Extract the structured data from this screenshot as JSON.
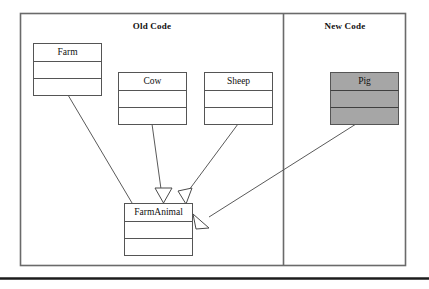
{
  "diagram": {
    "panels": [
      {
        "id": "old-code",
        "label": "Old Code"
      },
      {
        "id": "new-code",
        "label": "New Code"
      }
    ],
    "classes": [
      {
        "id": "farm",
        "name": "Farm",
        "fill": "#ffffff",
        "panel": "old-code"
      },
      {
        "id": "cow",
        "name": "Cow",
        "fill": "#ffffff",
        "panel": "old-code"
      },
      {
        "id": "sheep",
        "name": "Sheep",
        "fill": "#ffffff",
        "panel": "old-code"
      },
      {
        "id": "farmanimal",
        "name": "FarmAnimal",
        "fill": "#ffffff",
        "panel": "old-code"
      },
      {
        "id": "pig",
        "name": "Pig",
        "fill": "#a6a6a6",
        "panel": "new-code"
      }
    ],
    "relationships": [
      {
        "id": "farm-farmanimal",
        "from": "Farm",
        "to": "FarmAnimal",
        "type": "association"
      },
      {
        "id": "cow-farmanimal",
        "from": "Cow",
        "to": "FarmAnimal",
        "type": "generalization"
      },
      {
        "id": "sheep-farmanimal",
        "from": "Sheep",
        "to": "FarmAnimal",
        "type": "generalization"
      },
      {
        "id": "pig-farmanimal",
        "from": "Pig",
        "to": "FarmAnimal",
        "type": "generalization"
      }
    ],
    "colors": {
      "line": "#555555",
      "frame": "#666666",
      "box_border": "#555555",
      "highlight_fill": "#a6a6a6",
      "rule": "#1c1c1c",
      "background": "#ffffff"
    }
  }
}
